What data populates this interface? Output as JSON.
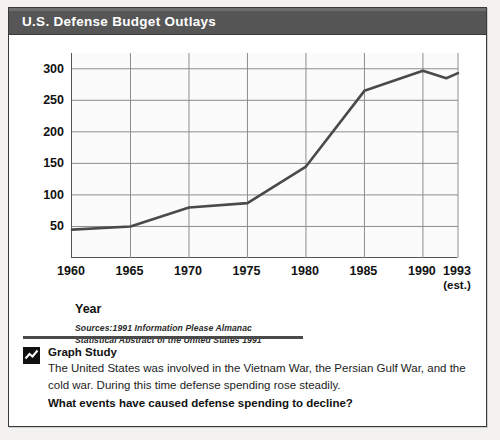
{
  "figure": {
    "title": "U.S. Defense Budget Outlays",
    "axis_title_x": "Year",
    "axis_title_y": "Dollars (in billions)",
    "sources_line1": "Sources:1991 Information Please Almanac",
    "sources_line2": "Statistical Abstract of the United States 1991"
  },
  "caption": {
    "icon": "line-chart-icon",
    "heading": "Graph Study",
    "body": "The United States was involved in the Vietnam War, the Persian Gulf War, and the cold war. During this time defense spending rose steadily.",
    "question": "What events have caused defense spending to decline?"
  },
  "chart_data": {
    "type": "line",
    "title": "U.S. Defense Budget Outlays",
    "xlabel": "Year",
    "ylabel": "Dollars (in billions)",
    "xlim": [
      1960,
      1993
    ],
    "ylim": [
      0,
      325
    ],
    "grid": true,
    "legend": "none",
    "line_color": "#4a4a4a",
    "x_tick_labels": [
      "1960",
      "1965",
      "1970",
      "1975",
      "1980",
      "1985",
      "1990",
      "1993"
    ],
    "x_tick_sublabels": [
      "",
      "",
      "",
      "",
      "",
      "",
      "",
      "(est.)"
    ],
    "x_tick_values": [
      1960,
      1965,
      1970,
      1975,
      1980,
      1985,
      1990,
      1993
    ],
    "y_tick_labels": [
      "50",
      "100",
      "150",
      "200",
      "250",
      "300"
    ],
    "y_tick_values": [
      50,
      100,
      150,
      200,
      250,
      300
    ],
    "x": [
      1960,
      1965,
      1970,
      1975,
      1980,
      1985,
      1990,
      1992,
      1993
    ],
    "values": [
      45,
      50,
      80,
      87,
      145,
      265,
      297,
      285,
      293
    ],
    "series": [
      {
        "name": "Defense budget outlays",
        "x": [
          1960,
          1965,
          1970,
          1975,
          1980,
          1985,
          1990,
          1992,
          1993
        ],
        "values": [
          45,
          50,
          80,
          87,
          145,
          265,
          297,
          285,
          293
        ]
      }
    ]
  }
}
